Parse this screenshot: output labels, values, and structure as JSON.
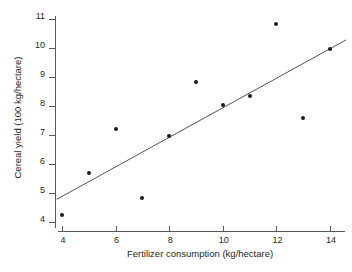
{
  "chart_data": {
    "type": "scatter",
    "title": "",
    "xlabel": "Fertilizer consumption (kg/hectare)",
    "ylabel": "Cereal yield (100 kg/hectare)",
    "xlim": [
      3.6,
      14.6
    ],
    "ylim": [
      3.85,
      11.1
    ],
    "grid": false,
    "legend": null,
    "x_ticks": [
      4,
      6,
      8,
      10,
      12,
      14
    ],
    "y_ticks": [
      4,
      5,
      6,
      7,
      8,
      9,
      10,
      11
    ],
    "x_tick_labels": [
      "4",
      "6",
      "8",
      "10",
      "12",
      "14"
    ],
    "y_tick_labels": [
      "4",
      "5",
      "6",
      "7",
      "8",
      "9",
      "10",
      "11"
    ],
    "x": [
      4,
      5,
      6,
      7,
      8,
      9,
      10,
      11,
      12,
      13,
      14
    ],
    "y": [
      4.25,
      5.68,
      7.22,
      4.82,
      6.95,
      8.82,
      8.05,
      8.33,
      10.83,
      7.58,
      9.97
    ],
    "points": [
      {
        "x": 4,
        "y": 4.25
      },
      {
        "x": 5,
        "y": 5.68
      },
      {
        "x": 6,
        "y": 7.22
      },
      {
        "x": 7,
        "y": 4.82
      },
      {
        "x": 8,
        "y": 6.95
      },
      {
        "x": 9,
        "y": 8.82
      },
      {
        "x": 10,
        "y": 8.05
      },
      {
        "x": 11,
        "y": 8.33
      },
      {
        "x": 12,
        "y": 10.83
      },
      {
        "x": 13,
        "y": 7.58
      },
      {
        "x": 14,
        "y": 9.97
      }
    ],
    "trend_line": {
      "type": "linear-fit",
      "x_start": 3.8,
      "y_start": 4.78,
      "x_end": 14.6,
      "y_end": 10.28,
      "color": "#3f3f3f"
    },
    "marker_color": "#1a1a1a",
    "axis_color": "#58595b"
  }
}
